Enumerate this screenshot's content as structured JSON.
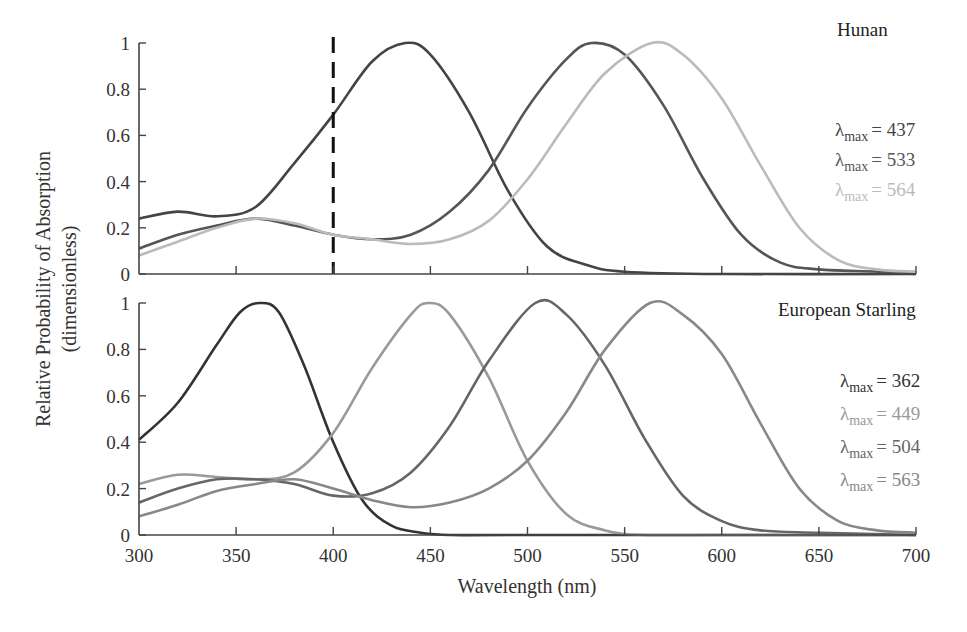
{
  "chart_data": {
    "type": "line",
    "ylabel_line1": "Relative Probability of Absorption",
    "ylabel_line2": "(dimensionless)",
    "xlabel": "Wavelength (nm)",
    "xlim": [
      300,
      700
    ],
    "ylim": [
      0,
      1
    ],
    "x_ticks": [
      300,
      350,
      400,
      450,
      500,
      550,
      600,
      650,
      700
    ],
    "y_ticks": [
      0,
      0.2,
      0.4,
      0.6,
      0.8,
      1
    ],
    "y_tick_labels": [
      "0",
      "0.2",
      "0.4",
      "0.6",
      "0.8",
      "1"
    ],
    "grid": false,
    "panels": [
      {
        "title": "Hunan",
        "annotation": {
          "type": "vline",
          "x": 400,
          "style": "dashed"
        },
        "legend": [
          {
            "symbol": "λ",
            "sub": "max",
            "text": "= 437",
            "color": "#444444"
          },
          {
            "symbol": "λ",
            "sub": "max",
            "text": "= 533",
            "color": "#555555"
          },
          {
            "symbol": "λ",
            "sub": "max",
            "text": "= 564",
            "color": "#bbbbbb"
          }
        ],
        "series": [
          {
            "name": "λmax = 437",
            "lambda_max": 437,
            "color": "#444444",
            "x": [
              300,
              320,
              340,
              360,
              380,
              400,
              420,
              437,
              450,
              470,
              490,
              510,
              530,
              550,
              600,
              700
            ],
            "y": [
              0.24,
              0.27,
              0.25,
              0.29,
              0.48,
              0.69,
              0.92,
              1.0,
              0.95,
              0.7,
              0.36,
              0.12,
              0.04,
              0.01,
              0.0,
              0.0
            ]
          },
          {
            "name": "λmax = 533",
            "lambda_max": 533,
            "color": "#555555",
            "x": [
              300,
              320,
              340,
              360,
              380,
              400,
              420,
              440,
              460,
              480,
              500,
              520,
              533,
              550,
              570,
              590,
              610,
              630,
              650,
              680,
              700
            ],
            "y": [
              0.11,
              0.17,
              0.21,
              0.24,
              0.21,
              0.17,
              0.15,
              0.17,
              0.27,
              0.45,
              0.72,
              0.93,
              1.0,
              0.95,
              0.73,
              0.42,
              0.17,
              0.05,
              0.02,
              0.01,
              0.0
            ]
          },
          {
            "name": "λmax = 564",
            "lambda_max": 564,
            "color": "#bbbbbb",
            "x": [
              300,
              320,
              340,
              360,
              380,
              400,
              420,
              440,
              460,
              480,
              500,
              520,
              540,
              564,
              580,
              600,
              620,
              640,
              660,
              680,
              700
            ],
            "y": [
              0.08,
              0.14,
              0.2,
              0.24,
              0.22,
              0.17,
              0.15,
              0.13,
              0.15,
              0.23,
              0.41,
              0.65,
              0.87,
              1.0,
              0.95,
              0.76,
              0.47,
              0.2,
              0.06,
              0.02,
              0.01
            ]
          }
        ]
      },
      {
        "title": "European Starling",
        "legend": [
          {
            "symbol": "λ",
            "sub": "max",
            "text": "= 362",
            "color": "#333333"
          },
          {
            "symbol": "λ",
            "sub": "max",
            "text": "= 449",
            "color": "#999999"
          },
          {
            "symbol": "λ",
            "sub": "max",
            "text": "= 504",
            "color": "#666666"
          },
          {
            "symbol": "λ",
            "sub": "max",
            "text": "= 563",
            "color": "#888888"
          }
        ],
        "series": [
          {
            "name": "λmax = 362",
            "lambda_max": 362,
            "color": "#333333",
            "x": [
              300,
              320,
              340,
              352,
              362,
              372,
              385,
              400,
              415,
              430,
              445,
              460,
              500,
              700
            ],
            "y": [
              0.41,
              0.57,
              0.82,
              0.96,
              1.0,
              0.96,
              0.73,
              0.4,
              0.15,
              0.04,
              0.01,
              0.0,
              0.0,
              0.0
            ]
          },
          {
            "name": "λmax = 449",
            "lambda_max": 449,
            "color": "#999999",
            "x": [
              300,
              320,
              340,
              360,
              380,
              400,
              420,
              440,
              449,
              460,
              480,
              500,
              520,
              540,
              560,
              600,
              700
            ],
            "y": [
              0.22,
              0.26,
              0.25,
              0.24,
              0.27,
              0.44,
              0.72,
              0.95,
              1.0,
              0.95,
              0.68,
              0.32,
              0.09,
              0.02,
              0.0,
              0.0,
              0.0
            ]
          },
          {
            "name": "λmax = 504",
            "lambda_max": 504,
            "color": "#666666",
            "x": [
              300,
              320,
              340,
              360,
              380,
              400,
              420,
              440,
              460,
              480,
              504,
              520,
              540,
              560,
              580,
              600,
              620,
              650,
              700
            ],
            "y": [
              0.14,
              0.2,
              0.24,
              0.24,
              0.22,
              0.17,
              0.18,
              0.27,
              0.47,
              0.75,
              1.0,
              0.95,
              0.73,
              0.42,
              0.17,
              0.06,
              0.02,
              0.01,
              0.0
            ]
          },
          {
            "name": "λmax = 563",
            "lambda_max": 563,
            "color": "#888888",
            "x": [
              300,
              320,
              340,
              360,
              380,
              400,
              420,
              440,
              460,
              480,
              500,
              520,
              540,
              563,
              580,
              600,
              620,
              640,
              660,
              680,
              700
            ],
            "y": [
              0.08,
              0.13,
              0.19,
              0.22,
              0.24,
              0.2,
              0.15,
              0.12,
              0.14,
              0.2,
              0.32,
              0.53,
              0.8,
              1.0,
              0.95,
              0.78,
              0.48,
              0.2,
              0.06,
              0.02,
              0.01
            ]
          }
        ]
      }
    ]
  }
}
